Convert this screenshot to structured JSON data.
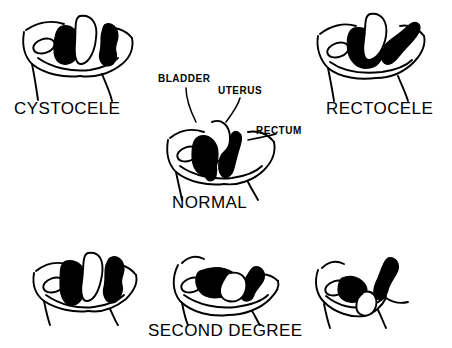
{
  "figure": {
    "background_color": "#ffffff",
    "ink_color": "#000000",
    "width": 452,
    "height": 348
  },
  "captions": {
    "cystocele": "CYSTOCELE",
    "rectocele": "RECTOCELE",
    "normal": "NORMAL",
    "second_degree": "SECOND DEGREE"
  },
  "annotations": {
    "bladder": "BLADDER",
    "uterus": "UTERUS",
    "rectum": "RECTUM"
  },
  "panels": [
    {
      "id": "cystocele",
      "caption": "CYSTOCELE",
      "row": "top",
      "position": "left"
    },
    {
      "id": "normal",
      "caption": "NORMAL",
      "row": "middle",
      "position": "center",
      "labels": [
        "BLADDER",
        "UTERUS",
        "RECTUM"
      ]
    },
    {
      "id": "rectocele",
      "caption": "RECTOCELE",
      "row": "top",
      "position": "right"
    },
    {
      "id": "second-degree-left",
      "caption": "SECOND DEGREE",
      "row": "bottom",
      "position": "left"
    },
    {
      "id": "second-degree-center",
      "caption": "SECOND DEGREE",
      "row": "bottom",
      "position": "center"
    },
    {
      "id": "second-degree-right",
      "caption": "SECOND DEGREE",
      "row": "bottom",
      "position": "right"
    }
  ]
}
